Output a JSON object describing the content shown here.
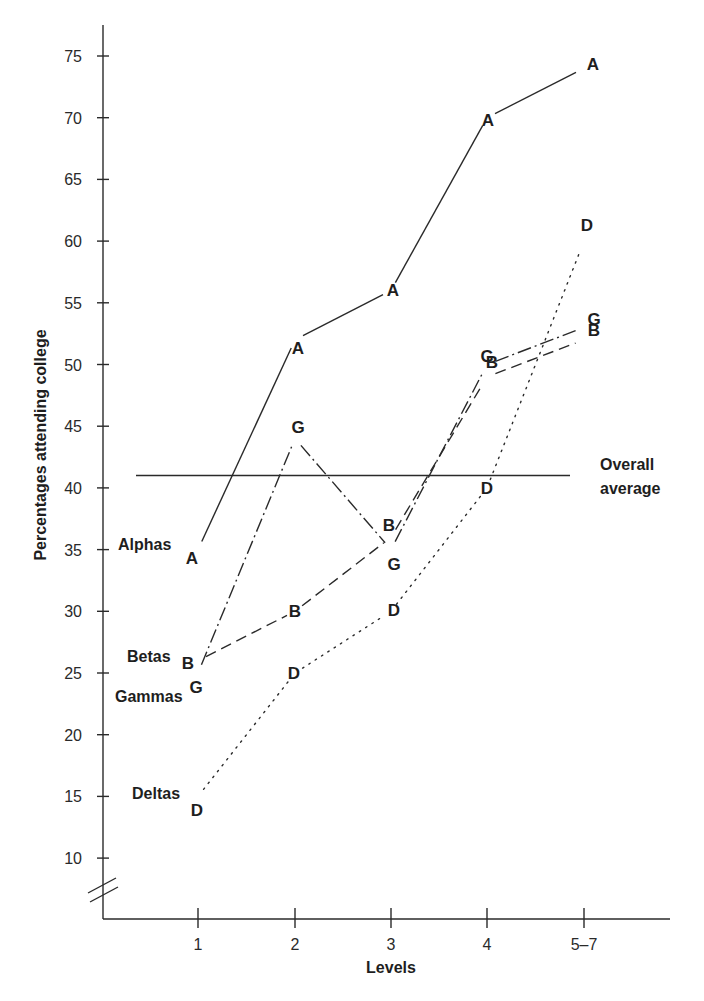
{
  "chart_data": {
    "type": "line",
    "title": "",
    "xlabel": "Levels",
    "ylabel": "Percentages attending college",
    "categories": [
      "1",
      "2",
      "3",
      "4",
      "5–7"
    ],
    "ylim": [
      10,
      75
    ],
    "yticks": [
      10,
      15,
      20,
      25,
      30,
      35,
      40,
      45,
      50,
      55,
      60,
      65,
      70,
      75
    ],
    "axis_break": true,
    "grid": false,
    "series": [
      {
        "name": "Alphas",
        "marker": "A",
        "style": "solid",
        "values": [
          35,
          52,
          56,
          70,
          74
        ]
      },
      {
        "name": "Betas",
        "marker": "B",
        "style": "dashed",
        "values": [
          26,
          30,
          36,
          49,
          52
        ]
      },
      {
        "name": "Gammas",
        "marker": "G",
        "style": "dash-dot",
        "values": [
          25,
          44,
          35,
          50,
          53
        ]
      },
      {
        "name": "Deltas",
        "marker": "D",
        "style": "dotted",
        "values": [
          15,
          25,
          30,
          40,
          60
        ]
      }
    ],
    "reference_lines": [
      {
        "label": "Overall average",
        "label_lines": [
          "Overall",
          "average"
        ],
        "value": 41
      }
    ]
  },
  "labels": {
    "ylabel": "Percentages attending college",
    "xlabel": "Levels",
    "xticks": [
      "1",
      "2",
      "3",
      "4",
      "5–7"
    ],
    "yticks": [
      "75",
      "70",
      "65",
      "60",
      "55",
      "50",
      "45",
      "40",
      "35",
      "30",
      "25",
      "20",
      "15",
      "10"
    ],
    "avg_line1": "Overall",
    "avg_line2": "average",
    "alphas": "Alphas",
    "betas": "Betas",
    "gammas": "Gammas",
    "deltas": "Deltas",
    "marker_a": "A",
    "marker_b": "B",
    "marker_g": "G",
    "marker_d": "D"
  }
}
